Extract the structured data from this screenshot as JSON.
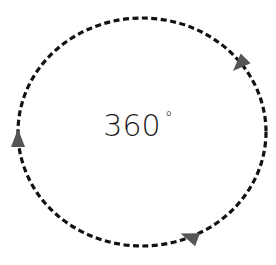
{
  "diagram": {
    "label_value": "360",
    "label_unit": "°",
    "shape": "dashed-ellipse",
    "direction": "clockwise",
    "arrow_count": 3,
    "colors": {
      "stroke": "#111111",
      "arrow_fill": "#555555",
      "text": "#1a1a1a",
      "background": "#ffffff"
    }
  }
}
